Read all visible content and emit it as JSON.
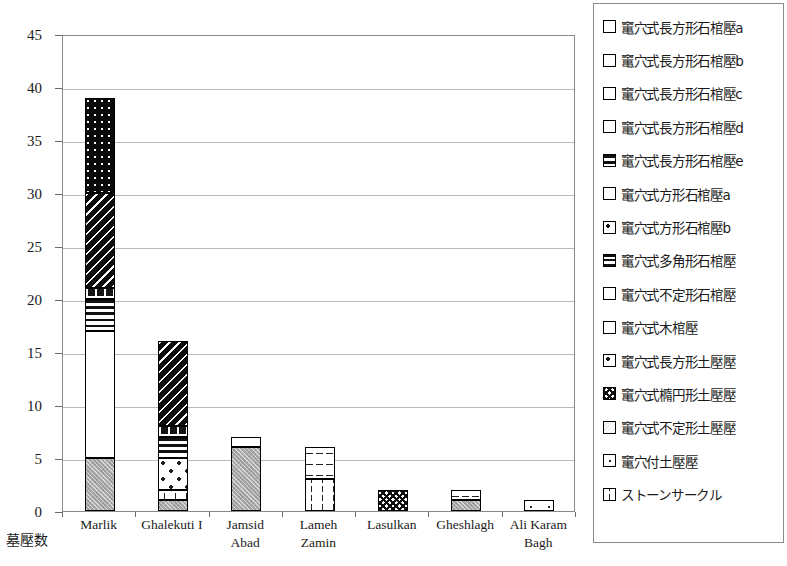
{
  "chart_data": {
    "type": "bar",
    "subtype": "stacked-vertical",
    "title": "",
    "xlabel": "",
    "ylabel": "墓壓数",
    "ylim": [
      0,
      45
    ],
    "yticks": [
      0,
      5,
      10,
      15,
      20,
      25,
      30,
      35,
      40,
      45
    ],
    "ytick_labels": [
      "0",
      "5",
      "10",
      "15",
      "20",
      "25",
      "30",
      "35",
      "40",
      "45"
    ],
    "grid": "horizontal",
    "legend_position": "right",
    "categories": [
      "Marlik",
      "Ghalekuti I",
      "Jamsid Abad",
      "Lameh Zamin",
      "Lasulkan",
      "Gheshlagh",
      "Ali Karam Bagh"
    ],
    "category_lines": [
      [
        "Marlik"
      ],
      [
        "Ghalekuti I"
      ],
      [
        "Jamsid",
        "Abad"
      ],
      [
        "Lameh",
        "Zamin"
      ],
      [
        "Lasulkan"
      ],
      [
        "Gheshlagh"
      ],
      [
        "Ali Karam",
        "Bagh"
      ]
    ],
    "totals": [
      39,
      16,
      7,
      6,
      2,
      2,
      1
    ],
    "series": [
      {
        "name": "竃穴式長方形石棺壓a",
        "pattern": "solid-black",
        "values": [
          0,
          0,
          0,
          0,
          0,
          0,
          0
        ]
      },
      {
        "name": "竃穴式長方形石棺壓b",
        "pattern": "black-speck",
        "values": [
          9,
          0,
          0,
          0,
          0,
          0,
          0
        ]
      },
      {
        "name": "竃穴式長方形石棺壓c",
        "pattern": "black-dots",
        "values": [
          0,
          0,
          0,
          0,
          0,
          0,
          0
        ]
      },
      {
        "name": "竃穴式長方形石棺壓d",
        "pattern": "black-diag",
        "values": [
          9,
          8,
          0,
          0,
          0,
          0,
          0
        ]
      },
      {
        "name": "竃穴式長方形石棺壓e",
        "pattern": "dark-wedge",
        "values": [
          1,
          1,
          0,
          0,
          0,
          0,
          0
        ]
      },
      {
        "name": "竃穴式方形石棺壓a",
        "pattern": "hstripe",
        "values": [
          3,
          2,
          0,
          0,
          0,
          0,
          0
        ]
      },
      {
        "name": "竃穴式方形石棺壓b",
        "pattern": "white-block",
        "values": [
          0,
          0,
          0,
          0,
          0,
          0,
          0
        ]
      },
      {
        "name": "竃穴式多角形石棺壓",
        "pattern": "hstripe-dense",
        "values": [
          0,
          0,
          0,
          0,
          0,
          0,
          0
        ]
      },
      {
        "name": "竃穴式不定形石棺壓",
        "pattern": "open",
        "values": [
          12,
          0,
          1,
          0,
          0,
          0,
          0
        ]
      },
      {
        "name": "竃穴式木棺壓",
        "pattern": "dot-med",
        "values": [
          0,
          3,
          0,
          0,
          0,
          0,
          0
        ]
      },
      {
        "name": "竃穴式長方形土壓壓",
        "pattern": "hdash",
        "values": [
          0,
          0,
          0,
          3,
          0,
          1,
          0
        ]
      },
      {
        "name": "竃穴式橢円形土壓壓",
        "pattern": "checker",
        "values": [
          0,
          0,
          0,
          0,
          2,
          0,
          0
        ]
      },
      {
        "name": "竃穴式不定形土壓壓",
        "pattern": "gray",
        "values": [
          5,
          1,
          6,
          0,
          0,
          1,
          0
        ]
      },
      {
        "name": "竃穴付土壓壓",
        "pattern": "tick",
        "values": [
          0,
          0,
          0,
          0,
          0,
          0,
          1
        ]
      },
      {
        "name": "ストーンサークル",
        "pattern": "vdash",
        "values": [
          0,
          1,
          0,
          3,
          0,
          0,
          0
        ]
      }
    ],
    "bars": [
      {
        "category": "Marlik",
        "total": 39,
        "segments": [
          {
            "label": "竃穴式不定形土壓壓",
            "pattern": "gray",
            "from": 0,
            "to": 5,
            "value": 5
          },
          {
            "label": "竃穴式不定形石棺壓",
            "pattern": "open",
            "from": 5,
            "to": 17,
            "value": 12
          },
          {
            "label": "竃穴式方形石棺壓a",
            "pattern": "hstripe",
            "from": 17,
            "to": 20,
            "value": 3
          },
          {
            "label": "竃穴式長方形石棺壓e",
            "pattern": "dark-wedge",
            "from": 20,
            "to": 21,
            "value": 1
          },
          {
            "label": "竃穴式長方形石棺壓d",
            "pattern": "black-diag",
            "from": 21,
            "to": 30,
            "value": 9
          },
          {
            "label": "竃穴式長方形石棺壓b",
            "pattern": "black-speck",
            "from": 30,
            "to": 39,
            "value": 9
          }
        ]
      },
      {
        "category": "Ghalekuti I",
        "total": 16,
        "segments": [
          {
            "label": "竃穴式不定形土壓壓",
            "pattern": "gray",
            "from": 0,
            "to": 1,
            "value": 1
          },
          {
            "label": "ストーンサークル",
            "pattern": "vdash",
            "from": 1,
            "to": 2,
            "value": 1
          },
          {
            "label": "竃穴式木棺壓",
            "pattern": "dot-med",
            "from": 2,
            "to": 5,
            "value": 3
          },
          {
            "label": "竃穴式方形石棺壓a",
            "pattern": "hstripe",
            "from": 5,
            "to": 7,
            "value": 2
          },
          {
            "label": "竃穴式長方形石棺壓e",
            "pattern": "dark-wedge",
            "from": 7,
            "to": 8,
            "value": 1
          },
          {
            "label": "竃穴式長方形石棺壓d",
            "pattern": "black-diag",
            "from": 8,
            "to": 16,
            "value": 8
          }
        ]
      },
      {
        "category": "Jamsid Abad",
        "total": 7,
        "segments": [
          {
            "label": "竃穴式不定形土壓壓",
            "pattern": "gray",
            "from": 0,
            "to": 6,
            "value": 6
          },
          {
            "label": "竃穴式不定形石棺壓",
            "pattern": "open",
            "from": 6,
            "to": 7,
            "value": 1
          }
        ]
      },
      {
        "category": "Lameh Zamin",
        "total": 6,
        "segments": [
          {
            "label": "ストーンサークル",
            "pattern": "vdash",
            "from": 0,
            "to": 3,
            "value": 3
          },
          {
            "label": "竃穴式長方形土壓壓",
            "pattern": "hdash",
            "from": 3,
            "to": 6,
            "value": 3
          }
        ]
      },
      {
        "category": "Lasulkan",
        "total": 2,
        "segments": [
          {
            "label": "竃穴式橢円形土壓壓",
            "pattern": "checker",
            "from": 0,
            "to": 2,
            "value": 2
          }
        ]
      },
      {
        "category": "Gheshlagh",
        "total": 2,
        "segments": [
          {
            "label": "竃穴式不定形土壓壓",
            "pattern": "gray",
            "from": 0,
            "to": 1,
            "value": 1
          },
          {
            "label": "竃穴式長方形土壓壓",
            "pattern": "hdash",
            "from": 1,
            "to": 2,
            "value": 1
          }
        ]
      },
      {
        "category": "Ali Karam Bagh",
        "total": 1,
        "segments": [
          {
            "label": "竃穴付土壓壓",
            "pattern": "tick",
            "from": 0,
            "to": 1,
            "value": 1
          }
        ]
      }
    ],
    "legend": [
      {
        "label": "竃穴式長方形石棺壓a",
        "pattern": "solid-black"
      },
      {
        "label": "竃穴式長方形石棺壓b",
        "pattern": "black-speck"
      },
      {
        "label": "竃穴式長方形石棺壓c",
        "pattern": "black-dots"
      },
      {
        "label": "竃穴式長方形石棺壓d",
        "pattern": "black-diag"
      },
      {
        "label": "竃穴式長方形石棺壓e",
        "pattern": "hstripe"
      },
      {
        "label": "竃穴式方形石棺壓a",
        "pattern": "open"
      },
      {
        "label": "竃穴式方形石棺壓b",
        "pattern": "white-block"
      },
      {
        "label": "竃穴式多角形石棺壓",
        "pattern": "hstripe-dense"
      },
      {
        "label": "竃穴式不定形石棺壓",
        "pattern": "open"
      },
      {
        "label": "竃穴式木棺壓",
        "pattern": "dark-wedge"
      },
      {
        "label": "竃穴式長方形土壓壓",
        "pattern": "white-block"
      },
      {
        "label": "竃穴式橢円形土壓壓",
        "pattern": "checker"
      },
      {
        "label": "竃穴式不定形土壓壓",
        "pattern": "gray"
      },
      {
        "label": "竃穴付土壓壓",
        "pattern": "tick"
      },
      {
        "label": "ストーンサークル",
        "pattern": "vdash"
      }
    ]
  }
}
